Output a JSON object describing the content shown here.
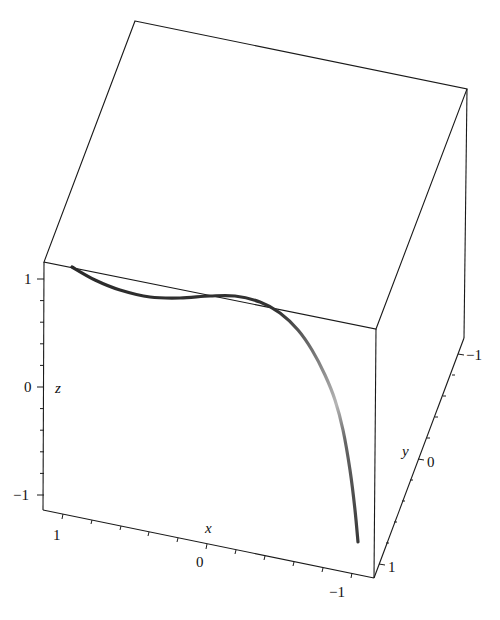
{
  "chart_data": {
    "type": "line",
    "subtype": "3d-space-curve",
    "title": "",
    "axes": {
      "x": {
        "label": "x",
        "range": [
          -1,
          1
        ],
        "ticks": [
          1,
          0,
          -1
        ],
        "tick_labels": [
          "1",
          "0",
          "−1"
        ]
      },
      "y": {
        "label": "y",
        "range": [
          -1,
          1
        ],
        "ticks": [
          -1,
          0,
          1
        ],
        "tick_labels": [
          "−1",
          "0",
          "1"
        ]
      },
      "z": {
        "label": "z",
        "range": [
          -1,
          1
        ],
        "ticks": [
          1,
          0,
          -1
        ],
        "tick_labels": [
          "1",
          "0",
          "−1"
        ]
      }
    },
    "box": "boxed",
    "grid": false,
    "legend": null,
    "series": [
      {
        "name": "space curve",
        "color": "#3a3a3a",
        "description": "Curve starts near (x=1, z=1), runs nearly flat near z≈0.8 through x≈0, then drops steeply toward z≈-1 as x→-1",
        "approx_points_xz": [
          [
            0.95,
            1.05
          ],
          [
            0.6,
            0.85
          ],
          [
            0.3,
            0.78
          ],
          [
            0.0,
            0.8
          ],
          [
            -0.2,
            0.75
          ],
          [
            -0.4,
            0.55
          ],
          [
            -0.55,
            0.3
          ],
          [
            -0.65,
            0.0
          ],
          [
            -0.72,
            -0.4
          ],
          [
            -0.8,
            -1.0
          ]
        ]
      }
    ]
  },
  "render": {
    "box_color": "#1a1a1a",
    "curve_stops": [
      "#2a2a2a",
      "#2a2a2a",
      "#555555",
      "#b0b0b0",
      "#5a5a5a",
      "#3a3a3a"
    ],
    "box": {
      "top_back_left": [
        135,
        21
      ],
      "top_back_right": [
        467,
        89
      ],
      "top_front_left": [
        44,
        262
      ],
      "top_front_right": [
        376,
        329
      ],
      "bottom_front_left": [
        43,
        510
      ],
      "bottom_front_right": [
        374,
        578
      ],
      "bottom_back_right": [
        464,
        338
      ]
    },
    "curve_path": [
      [
        72,
        267
      ],
      [
        95,
        280
      ],
      [
        120,
        290
      ],
      [
        150,
        297
      ],
      [
        180,
        298
      ],
      [
        210,
        296
      ],
      [
        235,
        296
      ],
      [
        260,
        302
      ],
      [
        280,
        313
      ],
      [
        298,
        330
      ],
      [
        312,
        350
      ],
      [
        325,
        375
      ],
      [
        335,
        400
      ],
      [
        343,
        430
      ],
      [
        350,
        470
      ],
      [
        355,
        510
      ],
      [
        358,
        542
      ]
    ]
  },
  "labels": {
    "z_name": "z",
    "x_name": "x",
    "y_name": "y",
    "z_ticks": [
      "1",
      "0",
      "−1"
    ],
    "x_ticks": [
      "1",
      "0",
      "−1"
    ],
    "y_ticks": [
      "−1",
      "0",
      "1"
    ]
  }
}
